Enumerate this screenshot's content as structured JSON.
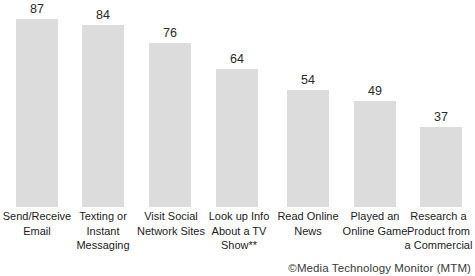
{
  "chart_data": {
    "type": "bar",
    "title": "",
    "subtitle": "",
    "xlabel": "",
    "ylabel": "",
    "ylim": [
      0,
      100
    ],
    "grid": false,
    "legend": null,
    "categories": [
      "Send/Receive\nEmail",
      "Texting or\nInstant\nMessaging",
      "Visit Social\nNetwork Sites",
      "Look up Info\nAbout a TV\nShow**",
      "Read Online\nNews",
      "Played an\nOnline Game",
      "Research a\nProduct from\na Commercial"
    ],
    "values": [
      87,
      84,
      76,
      64,
      54,
      49,
      37
    ],
    "data_labels": [
      "87",
      "84",
      "76",
      "64",
      "54",
      "49",
      "37"
    ],
    "bar_color": "#dcdcdc",
    "value_label_color": "#2b2b2b",
    "category_label_color": "#1c1c1c",
    "background_color": "#ffffff"
  },
  "annotations": {
    "copyright": "©Media Technology Monitor (MTM)"
  }
}
